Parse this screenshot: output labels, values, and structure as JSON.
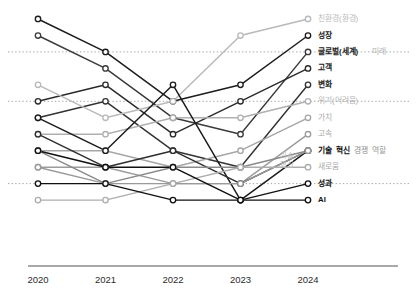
{
  "chart_data": {
    "type": "line",
    "title": "",
    "subtitle": "",
    "xlabel": "",
    "ylabel": "",
    "categories": [
      "2020",
      "2021",
      "2022",
      "2023",
      "2024"
    ],
    "x_tick_labels": [
      "2020",
      "2021",
      "2022",
      "2023",
      "2024"
    ],
    "ylim": [
      1,
      14
    ],
    "y_axis_inverted": true,
    "grid": "horizontal-dotted",
    "gridlines_y": [
      3,
      6,
      11
    ],
    "legend_position": "right-inline-labels",
    "series": [
      {
        "name": "성장",
        "label": "성장",
        "color": "#1c1c1c",
        "values": [
          1,
          3,
          6,
          5,
          2
        ]
      },
      {
        "name": "글로벌(세계)",
        "label": "글로벌(세계)",
        "secondary_label": "미래",
        "color": "#3a3a3a",
        "values": [
          2,
          4,
          7,
          8,
          3
        ]
      },
      {
        "name": "고객",
        "label": "고객",
        "color": "#2a2a2a",
        "values": [
          6,
          5,
          8,
          6,
          4
        ]
      },
      {
        "name": "변화",
        "label": "변화",
        "color": "#333333",
        "values": [
          7,
          6,
          9,
          10,
          5
        ]
      },
      {
        "name": "친환경(환경)",
        "label": "친환경(환경)",
        "color": "#b9b9b9",
        "values": [
          5,
          7,
          6,
          2,
          1
        ]
      },
      {
        "name": "위기(어려움)",
        "label": "위기(어려움)",
        "color": "#b0b0b0",
        "values": [
          8,
          8,
          7,
          7,
          6
        ]
      },
      {
        "name": "가치",
        "label": "가치",
        "color": "#a6a6a6",
        "values": [
          9,
          9,
          10,
          9,
          7
        ]
      },
      {
        "name": "고속",
        "label": "고속",
        "color": "#9c9c9c",
        "values": [
          10,
          10,
          11,
          11,
          8
        ]
      },
      {
        "name": "기술",
        "label": "기술",
        "color": "#1a1a1a",
        "values": [
          7,
          9,
          5,
          12,
          9
        ]
      },
      {
        "name": "혁신",
        "label": "혁신",
        "color": "#2e2e2e",
        "values": [
          8,
          10,
          9,
          11,
          9
        ]
      },
      {
        "name": "경쟁",
        "label": "경쟁",
        "color": "#8a8a8a",
        "values": [
          9,
          11,
          10,
          10,
          9
        ]
      },
      {
        "name": "역할",
        "label": "역할",
        "color": "#9a9a9a",
        "values": [
          10,
          11,
          11,
          11,
          9
        ]
      },
      {
        "name": "새로움",
        "label": "새로움",
        "color": "#adadad",
        "values": [
          12,
          12,
          11,
          10,
          10
        ]
      },
      {
        "name": "성과",
        "label": "성과",
        "color": "#111111",
        "values": [
          9,
          10,
          10,
          12,
          11
        ]
      },
      {
        "name": "AI",
        "label": "AI",
        "color": "#111111",
        "values": [
          11,
          11,
          12,
          12,
          12
        ]
      }
    ],
    "right_labels": [
      {
        "text": "친환경(환경)",
        "color": "#b9b9b9",
        "weight": "normal",
        "y_rank": 1
      },
      {
        "text": "성장",
        "color": "#1c1c1c",
        "weight": "bold",
        "y_rank": 2
      },
      {
        "text": "글로벌(세계)",
        "color": "#1c1c1c",
        "weight": "bold",
        "y_rank": 3
      },
      {
        "text": "미래",
        "color": "#b2b2b2",
        "weight": "normal",
        "y_rank": 3
      },
      {
        "text": "고객",
        "color": "#1c1c1c",
        "weight": "bold",
        "y_rank": 4
      },
      {
        "text": "변화",
        "color": "#1c1c1c",
        "weight": "bold",
        "y_rank": 5
      },
      {
        "text": "위기(어려움)",
        "color": "#b2b2b2",
        "weight": "normal",
        "y_rank": 6
      },
      {
        "text": "가치",
        "color": "#a8a8a8",
        "weight": "normal",
        "y_rank": 7
      },
      {
        "text": "고속",
        "color": "#a8a8a8",
        "weight": "normal",
        "y_rank": 8
      },
      {
        "text": "기술",
        "color": "#111111",
        "weight": "bold",
        "y_rank": 9
      },
      {
        "text": "혁신",
        "color": "#111111",
        "weight": "bold",
        "y_rank": 9
      },
      {
        "text": "경쟁",
        "color": "#8a8a8a",
        "weight": "normal",
        "y_rank": 9
      },
      {
        "text": "역할",
        "color": "#9a9a9a",
        "weight": "normal",
        "y_rank": 9
      },
      {
        "text": "새로움",
        "color": "#a8a8a8",
        "weight": "normal",
        "y_rank": 10
      },
      {
        "text": "성과",
        "color": "#111111",
        "weight": "bold",
        "y_rank": 11
      },
      {
        "text": "AI",
        "color": "#111111",
        "weight": "bold",
        "y_rank": 12
      }
    ],
    "inner_labels": [
      {
        "text": "기술",
        "color": "#bdbdbd",
        "x_year": "2024",
        "y_rank": 9.3
      },
      {
        "text": "혁신",
        "color": "#bdbdbd",
        "x_year": "2024",
        "y_rank": 9.9
      }
    ]
  },
  "axis": {
    "baseline_color": "#555555",
    "grid_color": "#9e9e9e",
    "marker_fill": "#ffffff"
  }
}
